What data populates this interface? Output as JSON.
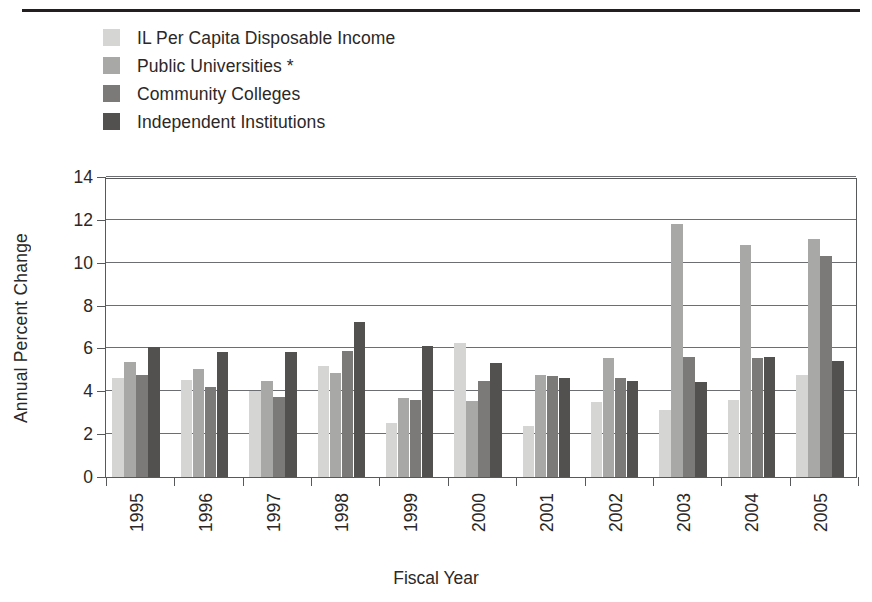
{
  "chart_data": {
    "type": "bar",
    "title": "",
    "xlabel": "Fiscal Year",
    "ylabel": "Annual Percent Change",
    "categories": [
      "1995",
      "1996",
      "1997",
      "1998",
      "1999",
      "2000",
      "2001",
      "2002",
      "2003",
      "2004",
      "2005"
    ],
    "ylim": [
      0,
      14
    ],
    "yticks": [
      0,
      2,
      4,
      6,
      8,
      10,
      12,
      14
    ],
    "grid": true,
    "legend_position": "above-plot-left",
    "series": [
      {
        "name": "IL Per Capita Disposable Income",
        "color": "#d5d5d3",
        "values": [
          4.6,
          4.55,
          4.0,
          5.2,
          2.5,
          6.25,
          2.4,
          3.5,
          3.15,
          3.6,
          4.75
        ]
      },
      {
        "name": "Public Universities *",
        "color": "#a8a8a6",
        "values": [
          5.35,
          5.05,
          4.5,
          4.85,
          3.7,
          3.55,
          4.75,
          5.55,
          11.8,
          10.85,
          11.1
        ]
      },
      {
        "name": "Community Colleges",
        "color": "#7b7a78",
        "values": [
          4.75,
          4.2,
          3.75,
          5.9,
          3.6,
          4.5,
          4.7,
          4.6,
          5.6,
          5.55,
          10.3
        ]
      },
      {
        "name": "Independent Institutions",
        "color": "#53514f",
        "values": [
          6.05,
          5.85,
          5.85,
          7.25,
          6.1,
          5.3,
          4.6,
          4.5,
          4.45,
          5.6,
          5.4
        ]
      }
    ]
  },
  "legend": {
    "items": [
      {
        "label": "IL Per Capita Disposable Income",
        "color": "#d5d5d3"
      },
      {
        "label": "Public Universities *",
        "color": "#a8a8a6"
      },
      {
        "label": "Community Colleges",
        "color": "#7b7a78"
      },
      {
        "label": "Independent Institutions",
        "color": "#53514f"
      }
    ]
  },
  "axes": {
    "y_title": "Annual Percent Change",
    "x_title": "Fiscal Year",
    "y_tick_labels": [
      "0",
      "2",
      "4",
      "6",
      "8",
      "10",
      "12",
      "14"
    ],
    "x_tick_labels": [
      "1995",
      "1996",
      "1997",
      "1998",
      "1999",
      "2000",
      "2001",
      "2002",
      "2003",
      "2004",
      "2005"
    ]
  },
  "colors": {
    "axis": "#58595b",
    "grid": "#6d6e71",
    "text": "#2b2827",
    "rule": "#231f20"
  }
}
